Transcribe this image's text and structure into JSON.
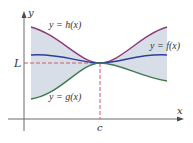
{
  "diagram": {
    "type": "squeeze-theorem",
    "axes": {
      "x_label": "x",
      "y_label": "y",
      "x_tick_label": "c",
      "y_tick_label": "L"
    },
    "curves": [
      {
        "id": "h",
        "label": "y = h(x)",
        "color": "#8a3a78",
        "role": "upper"
      },
      {
        "id": "f",
        "label": "y = f(x)",
        "color": "#2b3f9a",
        "role": "middle"
      },
      {
        "id": "g",
        "label": "y = g(x)",
        "color": "#3f7a4c",
        "role": "lower"
      }
    ],
    "colors": {
      "region_fill": "#d8dee7",
      "dashed_guides": "#d05a66",
      "axis": "#6a6a6a"
    }
  }
}
